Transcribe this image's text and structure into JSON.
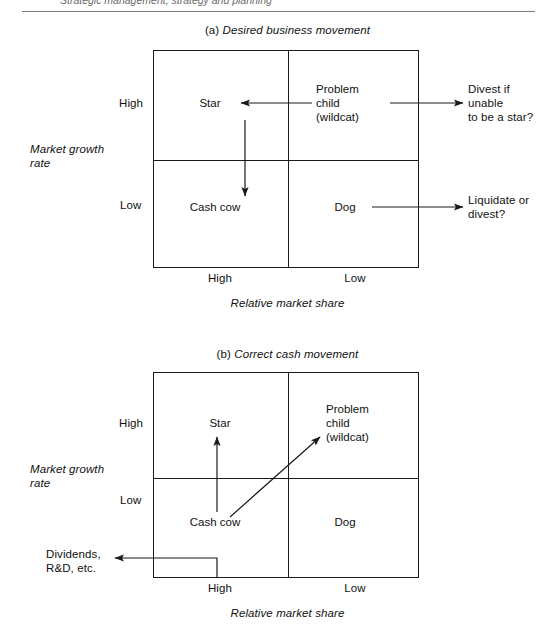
{
  "page": {
    "header_fragment": "Strategic management, strategy and planning",
    "background": "#ffffff",
    "ink": "#1a1a1a"
  },
  "diagrams": [
    {
      "id": "desired-business-movement",
      "caption_marker": "(a)",
      "caption_text": "Desired business movement",
      "y_axis_title": "Market growth\nrate",
      "y_axis_title_line1": "Market growth",
      "y_axis_title_line2": "rate",
      "y_axis_labels": [
        "High",
        "Low"
      ],
      "x_axis_title": "Relative market share",
      "x_axis_labels": [
        "High",
        "Low"
      ],
      "cells": [
        {
          "name": "star",
          "label": "Star",
          "row": "High",
          "col": "High"
        },
        {
          "name": "problem-child",
          "label": "Problem\nchild\n(wildcat)",
          "line1": "Problem",
          "line2": "child",
          "line3": "(wildcat)",
          "row": "High",
          "col": "Low"
        },
        {
          "name": "cash-cow",
          "label": "Cash cow",
          "row": "Low",
          "col": "High"
        },
        {
          "name": "dog",
          "label": "Dog",
          "row": "Low",
          "col": "Low"
        }
      ],
      "annotations": [
        {
          "name": "divest-if-unable",
          "line1": "Divest if",
          "line2": "unable",
          "line3": "to be a star?"
        },
        {
          "name": "liquidate-or-divest",
          "line1": "Liquidate or",
          "line2": "divest?"
        }
      ],
      "flows": [
        {
          "name": "problem-child-to-star",
          "from": "Problem child (wildcat)",
          "to": "Star",
          "direction": "left"
        },
        {
          "name": "star-to-cash-cow",
          "from": "Star",
          "to": "Cash cow",
          "direction": "down"
        },
        {
          "name": "problem-child-to-divest",
          "from": "Problem child (wildcat)",
          "to": "Divest if unable to be a star?",
          "direction": "right"
        },
        {
          "name": "dog-to-liquidate",
          "from": "Dog",
          "to": "Liquidate or divest?",
          "direction": "right"
        }
      ]
    },
    {
      "id": "correct-cash-movement",
      "caption_marker": "(b)",
      "caption_text": "Correct cash movement",
      "y_axis_title_line1": "Market growth",
      "y_axis_title_line2": "rate",
      "y_axis_labels": [
        "High",
        "Low"
      ],
      "x_axis_title": "Relative market share",
      "x_axis_labels": [
        "High",
        "Low"
      ],
      "cells": [
        {
          "name": "star",
          "label": "Star",
          "row": "High",
          "col": "High"
        },
        {
          "name": "problem-child",
          "label": "Problem\nchild\n(wildcat)",
          "line1": "Problem",
          "line2": "child",
          "line3": "(wildcat)",
          "row": "High",
          "col": "Low"
        },
        {
          "name": "cash-cow",
          "label": "Cash cow",
          "row": "Low",
          "col": "High"
        },
        {
          "name": "dog",
          "label": "Dog",
          "row": "Low",
          "col": "Low"
        }
      ],
      "annotations": [
        {
          "name": "dividends-rd",
          "line1": "Dividends,",
          "line2": "R&D, etc."
        }
      ],
      "flows": [
        {
          "name": "cash-cow-to-star",
          "from": "Cash cow",
          "to": "Star",
          "direction": "up"
        },
        {
          "name": "cash-cow-to-problem-child",
          "from": "Cash cow",
          "to": "Problem child (wildcat)",
          "direction": "diagonal-up-right"
        },
        {
          "name": "cash-cow-to-dividends",
          "from": "Cash cow",
          "to": "Dividends, R&D, etc.",
          "direction": "left"
        }
      ]
    }
  ]
}
